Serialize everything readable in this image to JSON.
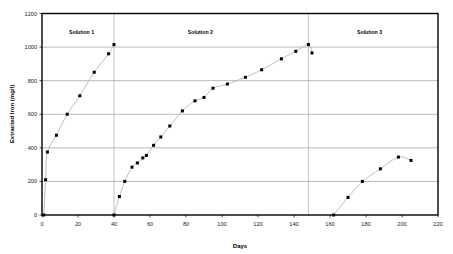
{
  "chart_data": {
    "type": "scatter",
    "title": "",
    "xlabel": "Days",
    "ylabel": "Extracted Iron (mg/l)",
    "xlim": [
      0,
      220
    ],
    "ylim": [
      0,
      1200
    ],
    "xticks": [
      0,
      20,
      40,
      60,
      80,
      100,
      120,
      140,
      160,
      180,
      200,
      220
    ],
    "yticks": [
      0,
      200,
      400,
      600,
      800,
      1000,
      1200
    ],
    "grid": "horizontal",
    "legend_position": "none",
    "annotations": [
      {
        "text": "Solution 1",
        "x": 22,
        "y": 1080
      },
      {
        "text": "Solution 2",
        "x": 88,
        "y": 1080
      },
      {
        "text": "Solution 3",
        "x": 182,
        "y": 1080
      }
    ],
    "dividers": [
      40,
      148
    ],
    "series": [
      {
        "name": "Solution 1",
        "points": [
          [
            1,
            0
          ],
          [
            2,
            210
          ],
          [
            3,
            375
          ],
          [
            8,
            475
          ],
          [
            14,
            600
          ],
          [
            21,
            710
          ],
          [
            29,
            850
          ],
          [
            37,
            960
          ],
          [
            40,
            1015
          ]
        ]
      },
      {
        "name": "Solution 2",
        "points": [
          [
            40,
            0
          ],
          [
            43,
            110
          ],
          [
            46,
            200
          ],
          [
            50,
            285
          ],
          [
            53,
            310
          ],
          [
            56,
            340
          ],
          [
            58,
            355
          ],
          [
            62,
            415
          ],
          [
            66,
            465
          ],
          [
            71,
            530
          ],
          [
            78,
            620
          ],
          [
            85,
            680
          ],
          [
            90,
            700
          ],
          [
            95,
            755
          ],
          [
            103,
            780
          ],
          [
            113,
            820
          ],
          [
            122,
            865
          ],
          [
            133,
            930
          ],
          [
            141,
            975
          ],
          [
            148,
            1015
          ],
          [
            150,
            965
          ]
        ]
      },
      {
        "name": "Solution 3",
        "points": [
          [
            162,
            0
          ],
          [
            170,
            105
          ],
          [
            178,
            200
          ],
          [
            188,
            275
          ],
          [
            198,
            345
          ],
          [
            205,
            325
          ]
        ]
      }
    ]
  }
}
